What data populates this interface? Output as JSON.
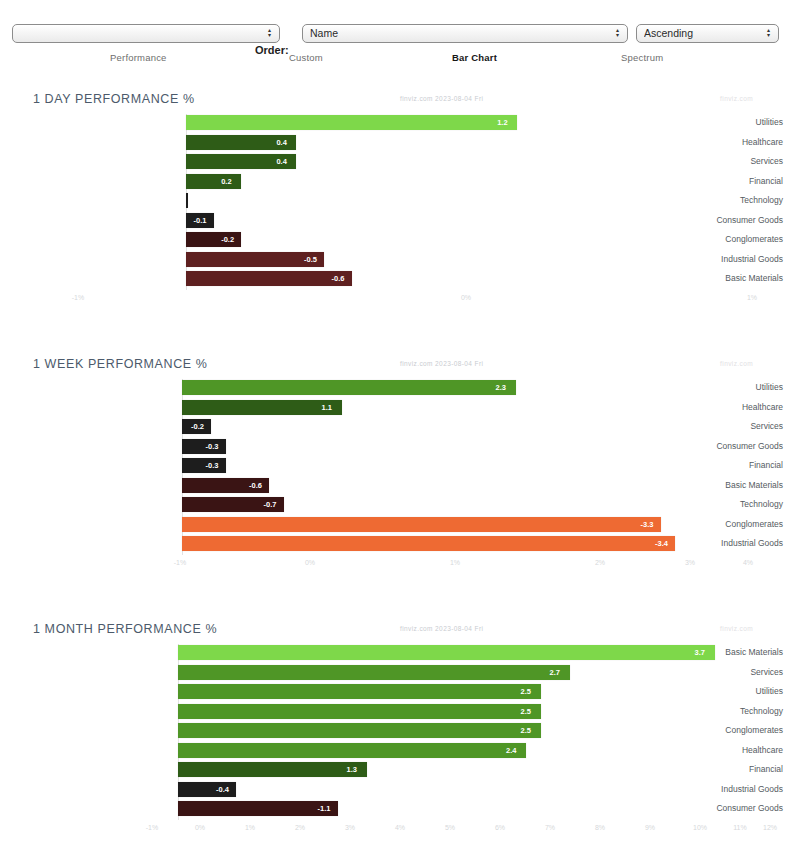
{
  "toolbar": {
    "filter_select": {
      "value": "",
      "placeholder": ""
    },
    "order_label": "Order:",
    "order_select": {
      "value": "Name"
    },
    "direction_select": {
      "value": "Ascending"
    },
    "arrow_up_glyph": "▴",
    "arrow_down_glyph": "▾"
  },
  "tabs": [
    {
      "label": "Performance",
      "active": false
    },
    {
      "label": "Custom",
      "active": false
    },
    {
      "label": "Bar Chart",
      "active": true
    },
    {
      "label": "Spectrum",
      "active": false
    }
  ],
  "colors": {
    "strong_green": "#7ed84a",
    "mid_green": "#4f9626",
    "dark_green": "#2e5c17",
    "near_zero_dark": "#1d1d1d",
    "dark_red": "#3a1414",
    "mid_red": "#5e2020",
    "strong_red": "#7a2a22",
    "orange": "#ee6a33",
    "axis_text": "#d6d8db",
    "title_text": "#4c5a6b",
    "category_text": "#555b62"
  },
  "chart_data": [
    {
      "type": "bar",
      "orientation": "horizontal",
      "title": "1 DAY PERFORMANCE %",
      "subtitle": "finviz.com 2023-08-04 Fri",
      "watermark": "finviz.com",
      "xlabel": "",
      "ylabel": "",
      "grid": false,
      "legend": false,
      "xlim": [
        -0.7,
        1.3
      ],
      "ticks": [
        "-1%",
        "0%",
        "1%"
      ],
      "categories": [
        "Utilities",
        "Healthcare",
        "Services",
        "Financial",
        "Technology",
        "Consumer Goods",
        "Conglomerates",
        "Industrial Goods",
        "Basic Materials"
      ],
      "values": [
        1.2,
        0.4,
        0.4,
        0.2,
        0.0,
        -0.1,
        -0.2,
        -0.5,
        -0.6
      ],
      "labels": [
        "1.2",
        "0.4",
        "0.4",
        "0.2",
        "0.0",
        "-0.1",
        "-0.2",
        "-0.5",
        "-0.6"
      ]
    },
    {
      "type": "bar",
      "orientation": "horizontal",
      "title": "1 WEEK PERFORMANCE %",
      "subtitle": "finviz.com 2023-08-04 Fri",
      "watermark": "finviz.com",
      "xlabel": "",
      "ylabel": "",
      "grid": false,
      "legend": false,
      "xlim": [
        -3.6,
        4.4
      ],
      "ticks": [
        "-1%",
        "0%",
        "1%",
        "2%",
        "3%",
        "4%"
      ],
      "categories": [
        "Utilities",
        "Healthcare",
        "Services",
        "Consumer Goods",
        "Financial",
        "Basic Materials",
        "Technology",
        "Conglomerates",
        "Industrial Goods"
      ],
      "values": [
        2.3,
        1.1,
        -0.2,
        -0.3,
        -0.3,
        -0.6,
        -0.7,
        -3.3,
        -3.4
      ],
      "labels": [
        "2.3",
        "1.1",
        "-0.2",
        "-0.3",
        "-0.3",
        "-0.6",
        "-0.7",
        "-3.3",
        "-3.4"
      ]
    },
    {
      "type": "bar",
      "orientation": "horizontal",
      "title": "1 MONTH PERFORMANCE %",
      "subtitle": "finviz.com 2023-08-04 Fri",
      "watermark": "finviz.com",
      "xlabel": "",
      "ylabel": "",
      "grid": false,
      "legend": false,
      "xlim": [
        -1.2,
        4.0
      ],
      "ticks": [
        "-1%",
        "0%",
        "1%",
        "2%",
        "3%",
        "4%",
        "5%",
        "6%",
        "7%",
        "8%",
        "9%",
        "10%",
        "11%",
        "12%"
      ],
      "categories": [
        "Basic Materials",
        "Services",
        "Utilities",
        "Technology",
        "Conglomerates",
        "Healthcare",
        "Financial",
        "Industrial Goods",
        "Consumer Goods"
      ],
      "values": [
        3.7,
        2.7,
        2.5,
        2.5,
        2.5,
        2.4,
        1.3,
        -0.4,
        -1.1
      ],
      "labels": [
        "3.7",
        "2.7",
        "2.5",
        "2.5",
        "2.5",
        "2.4",
        "1.3",
        "-0.4",
        "-1.1"
      ]
    }
  ],
  "chart_layout": [
    {
      "top": 92,
      "plot_left": 186,
      "plot_right": 738,
      "zero_x": 186,
      "px_per_unit": 276,
      "row_h": 19.5,
      "bar_h": 15,
      "axis_offset": 188,
      "tick_pos": [
        78,
        466,
        752
      ]
    },
    {
      "top": 357,
      "plot_left": 182,
      "plot_right": 742,
      "zero_x": 182,
      "px_per_unit": 145,
      "row_h": 19.5,
      "bar_h": 15,
      "axis_offset": 188,
      "tick_pos": [
        180,
        310,
        455,
        600,
        690,
        748
      ]
    },
    {
      "top": 622,
      "plot_left": 178,
      "plot_right": 742,
      "zero_x": 178,
      "px_per_unit": 145,
      "row_h": 19.5,
      "bar_h": 15,
      "axis_offset": 188,
      "tick_pos": [
        152,
        200,
        250,
        300,
        350,
        400,
        450,
        500,
        550,
        600,
        650,
        700,
        740,
        770
      ]
    }
  ]
}
